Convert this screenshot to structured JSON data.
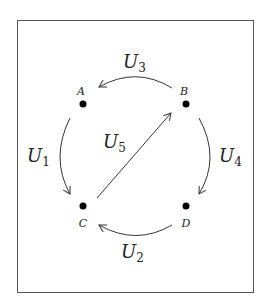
{
  "diagram": {
    "nodes": [
      {
        "id": "A",
        "label": "A"
      },
      {
        "id": "B",
        "label": "B"
      },
      {
        "id": "C",
        "label": "C"
      },
      {
        "id": "D",
        "label": "D"
      }
    ],
    "edges": [
      {
        "id": "U1",
        "from": "A",
        "to": "C",
        "label_main": "U",
        "label_sub": "1"
      },
      {
        "id": "U2",
        "from": "D",
        "to": "C",
        "label_main": "U",
        "label_sub": "2"
      },
      {
        "id": "U3",
        "from": "B",
        "to": "A",
        "label_main": "U",
        "label_sub": "3"
      },
      {
        "id": "U4",
        "from": "B",
        "to": "D",
        "label_main": "U",
        "label_sub": "4"
      },
      {
        "id": "U5",
        "from": "C",
        "to": "B",
        "label_main": "U",
        "label_sub": "5"
      }
    ],
    "colors": {
      "stroke": "#333333",
      "node": "#000000",
      "frame": "#555555"
    }
  }
}
